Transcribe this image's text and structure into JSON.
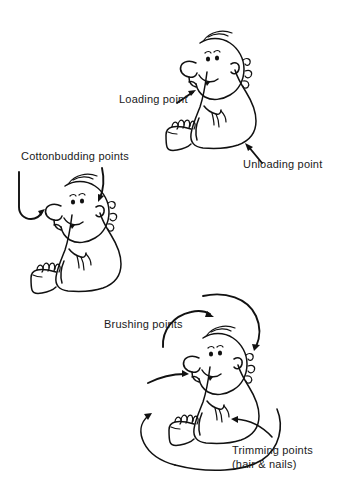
{
  "page": {
    "background_color": "#ffffff",
    "ink_color": "#111111",
    "width": 339,
    "height": 499
  },
  "labels": {
    "loading_point": "Loading point",
    "unloading_point": "Unloading point",
    "cottonbudding_points": "Cottonbudding points",
    "brushing_points": "Brushing points",
    "trimming_points_line1": "Trimming points",
    "trimming_points_line2": "(hair & nails)"
  },
  "figures": [
    {
      "id": "baby-top-right",
      "description": "Seated cartoon baby facing left, with arrows marking feeding points",
      "annotations": [
        "loading_point",
        "unloading_point"
      ]
    },
    {
      "id": "baby-middle-left",
      "description": "Seated cartoon baby facing left, with arrows to nose and ear",
      "annotations": [
        "cottonbudding_points"
      ]
    },
    {
      "id": "baby-bottom-right",
      "description": "Seated cartoon baby facing left, with arrows to hair, teeth, fingernails and toenails",
      "annotations": [
        "brushing_points",
        "trimming_points_line1",
        "trimming_points_line2"
      ]
    }
  ]
}
